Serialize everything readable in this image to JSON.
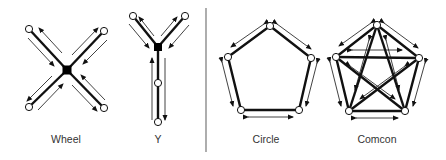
{
  "figure": {
    "networks": [
      {
        "id": "wheel",
        "label": "Wheel",
        "center_x": 66
      },
      {
        "id": "y",
        "label": "Y",
        "center_x": 158
      },
      {
        "id": "circle",
        "label": "Circle",
        "center_x": 266
      },
      {
        "id": "comcon",
        "label": "Comcon",
        "center_x": 377
      }
    ],
    "colors": {
      "line": "#111111",
      "node_fill": "#ffffff",
      "hub_fill": "#000000",
      "divider": "#777777",
      "text": "#333333"
    }
  }
}
